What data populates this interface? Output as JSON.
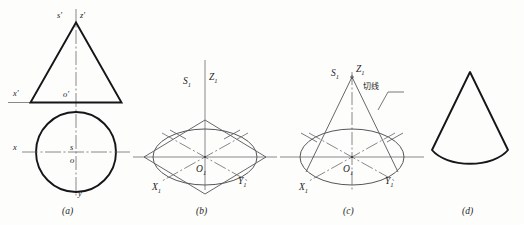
{
  "figure": {
    "background_color": "#fdfdfb",
    "ink_color": "#1c1c1c",
    "thin_color": "#55565a",
    "panels": [
      {
        "key": "a",
        "caption": "(a)",
        "description": "Orthographic front view (triangle) and top view (circle) of a cone",
        "labels": {
          "apex_left": "s'",
          "apex_right": "z'",
          "base_left": "x'",
          "base_center": "o'",
          "circle_left": "x",
          "circle_center_upper": "s",
          "circle_center_lower": "o",
          "circle_bottom": "y"
        }
      },
      {
        "key": "b",
        "caption": "(b)",
        "description": "Isometric rhombus with inscribed ellipse forming the cone base",
        "labels": {
          "axis_left": "S",
          "axis_left_sub": "1",
          "axis_right": "Z",
          "axis_right_sub": "1",
          "origin": "O",
          "origin_sub": "1",
          "axis_x": "X",
          "axis_x_sub": "1",
          "axis_y": "Y",
          "axis_y_sub": "1"
        }
      },
      {
        "key": "c",
        "caption": "(c)",
        "description": "Tangent lines drawn from the apex to the base ellipse",
        "annotation": "切线",
        "labels": {
          "apex_left": "S",
          "apex_left_sub": "1",
          "apex_right": "Z",
          "apex_right_sub": "1",
          "origin": "O",
          "origin_sub": "1",
          "axis_x": "X",
          "axis_x_sub": "1",
          "axis_y": "Y",
          "axis_y_sub": "1"
        }
      },
      {
        "key": "d",
        "caption": "(d)",
        "description": "Completed isometric outline of the cone"
      }
    ]
  }
}
